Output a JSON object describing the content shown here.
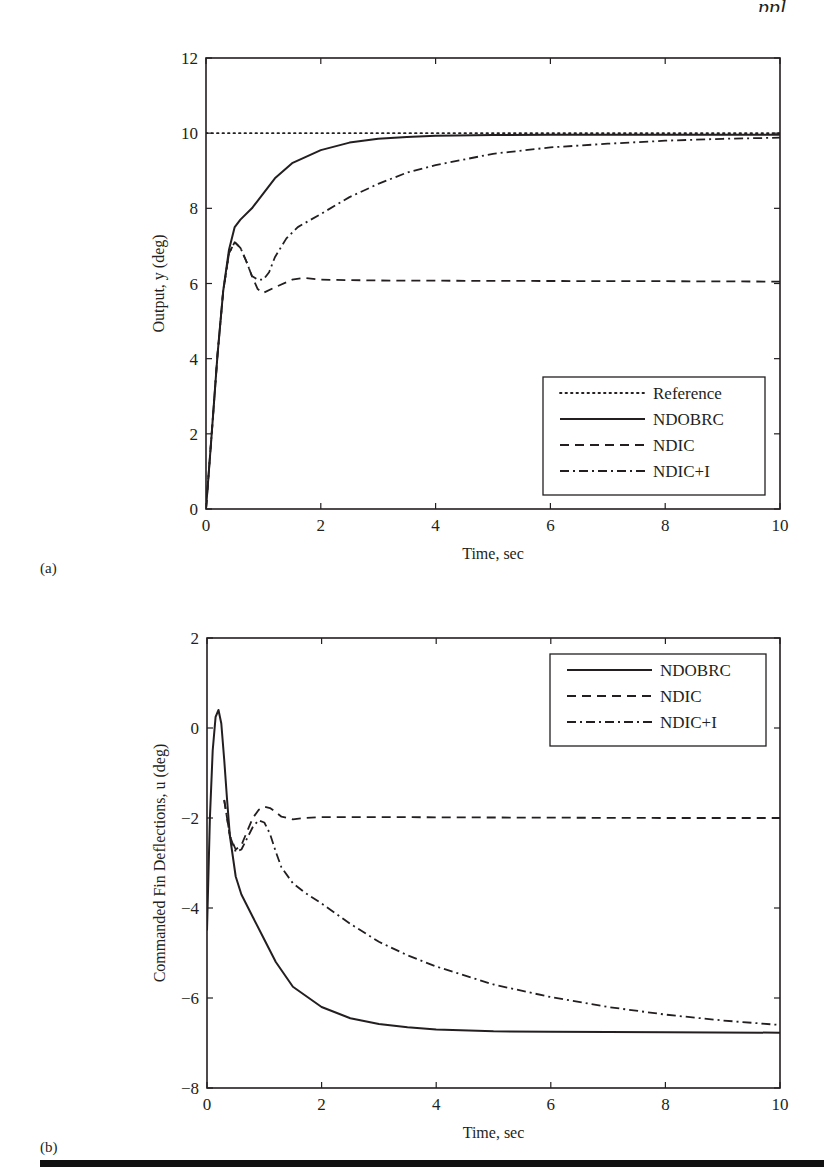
{
  "page": {
    "header_fragment": "ppl",
    "bottom_rule_color": "#111111"
  },
  "chart_data": [
    {
      "id": "a",
      "panel_label": "(a)",
      "type": "line",
      "title": "",
      "xlabel": "Time, sec",
      "ylabel": "Output, y (deg)",
      "xlim": [
        0,
        10
      ],
      "ylim": [
        0,
        12
      ],
      "xticks": [
        0,
        2,
        4,
        6,
        8,
        10
      ],
      "yticks": [
        0,
        2,
        4,
        6,
        8,
        10,
        12
      ],
      "grid": false,
      "legend_position": "lower right",
      "box": {
        "left": 206,
        "top": 58,
        "right": 780,
        "bottom": 509
      },
      "legend_box": {
        "x": 543,
        "y": 377,
        "w": 222,
        "h": 118
      },
      "series": [
        {
          "name": "Reference",
          "style": "dotted",
          "x": [
            0,
            10
          ],
          "y": [
            10,
            10
          ]
        },
        {
          "name": "NDOBRC",
          "style": "solid",
          "x": [
            0,
            0.1,
            0.2,
            0.3,
            0.4,
            0.5,
            0.6,
            0.8,
            1.0,
            1.2,
            1.5,
            2.0,
            2.5,
            3.0,
            3.5,
            4.0,
            5.0,
            6.0,
            8.0,
            10.0
          ],
          "y": [
            0,
            2.0,
            4.1,
            5.8,
            6.9,
            7.5,
            7.7,
            8.0,
            8.4,
            8.8,
            9.2,
            9.55,
            9.75,
            9.85,
            9.9,
            9.93,
            9.95,
            9.96,
            9.96,
            9.96
          ]
        },
        {
          "name": "NDIC",
          "style": "dashed",
          "x": [
            0,
            0.1,
            0.2,
            0.3,
            0.4,
            0.5,
            0.6,
            0.7,
            0.8,
            0.9,
            1.0,
            1.2,
            1.5,
            1.7,
            2.0,
            3.0,
            5.0,
            8.0,
            10.0
          ],
          "y": [
            0,
            2.0,
            4.1,
            5.8,
            6.8,
            7.1,
            6.95,
            6.6,
            6.2,
            5.85,
            5.75,
            5.9,
            6.1,
            6.15,
            6.1,
            6.08,
            6.07,
            6.06,
            6.05
          ]
        },
        {
          "name": "NDIC+I",
          "style": "dashdot",
          "x": [
            0,
            0.1,
            0.2,
            0.3,
            0.4,
            0.5,
            0.6,
            0.7,
            0.8,
            0.9,
            1.0,
            1.1,
            1.2,
            1.4,
            1.6,
            2.0,
            2.5,
            3.0,
            3.5,
            4.0,
            5.0,
            6.0,
            7.0,
            8.0,
            9.0,
            10.0
          ],
          "y": [
            0,
            2.0,
            4.1,
            5.8,
            6.8,
            7.1,
            6.95,
            6.6,
            6.2,
            6.1,
            6.1,
            6.3,
            6.7,
            7.2,
            7.5,
            7.85,
            8.3,
            8.65,
            8.95,
            9.15,
            9.45,
            9.62,
            9.72,
            9.8,
            9.85,
            9.88
          ]
        }
      ]
    },
    {
      "id": "b",
      "panel_label": "(b)",
      "type": "line",
      "title": "",
      "xlabel": "Time, sec",
      "ylabel": "Commanded Fin Deflections, u (deg)",
      "xlim": [
        0,
        10
      ],
      "ylim": [
        -8,
        2
      ],
      "xticks": [
        0,
        2,
        4,
        6,
        8,
        10
      ],
      "yticks": [
        -8,
        -6,
        -4,
        -2,
        0,
        2
      ],
      "grid": false,
      "legend_position": "upper right",
      "box": {
        "left": 207,
        "top": 638,
        "right": 780,
        "bottom": 1088
      },
      "legend_box": {
        "x": 550,
        "y": 654,
        "w": 216,
        "h": 92
      },
      "series": [
        {
          "name": "NDOBRC",
          "style": "solid",
          "x": [
            0,
            0.05,
            0.1,
            0.15,
            0.2,
            0.25,
            0.3,
            0.35,
            0.4,
            0.5,
            0.6,
            0.8,
            1.0,
            1.2,
            1.5,
            2.0,
            2.5,
            3.0,
            3.5,
            4.0,
            5.0,
            6.0,
            8.0,
            10.0
          ],
          "y": [
            -4.5,
            -2.0,
            -0.5,
            0.25,
            0.4,
            0.1,
            -0.7,
            -1.6,
            -2.4,
            -3.3,
            -3.7,
            -4.2,
            -4.7,
            -5.2,
            -5.75,
            -6.2,
            -6.45,
            -6.58,
            -6.65,
            -6.7,
            -6.74,
            -6.75,
            -6.76,
            -6.77
          ]
        },
        {
          "name": "NDIC",
          "style": "dashed",
          "x": [
            0.3,
            0.4,
            0.5,
            0.6,
            0.7,
            0.8,
            0.9,
            1.0,
            1.1,
            1.2,
            1.3,
            1.5,
            1.7,
            2.0,
            3.0,
            5.0,
            8.0,
            10.0
          ],
          "y": [
            -1.6,
            -2.4,
            -2.7,
            -2.6,
            -2.3,
            -2.0,
            -1.82,
            -1.75,
            -1.78,
            -1.87,
            -1.97,
            -2.03,
            -2.0,
            -1.98,
            -1.98,
            -1.99,
            -2.0,
            -2.0
          ]
        },
        {
          "name": "NDIC+I",
          "style": "dashdot",
          "x": [
            0.3,
            0.4,
            0.5,
            0.6,
            0.7,
            0.8,
            0.9,
            1.0,
            1.1,
            1.2,
            1.3,
            1.5,
            1.7,
            2.0,
            2.5,
            3.0,
            3.5,
            4.0,
            5.0,
            6.0,
            7.0,
            8.0,
            9.0,
            10.0
          ],
          "y": [
            -1.6,
            -2.4,
            -2.75,
            -2.7,
            -2.45,
            -2.2,
            -2.05,
            -2.1,
            -2.35,
            -2.75,
            -3.1,
            -3.45,
            -3.65,
            -3.9,
            -4.35,
            -4.75,
            -5.05,
            -5.3,
            -5.7,
            -5.98,
            -6.2,
            -6.37,
            -6.5,
            -6.6
          ]
        }
      ]
    }
  ]
}
